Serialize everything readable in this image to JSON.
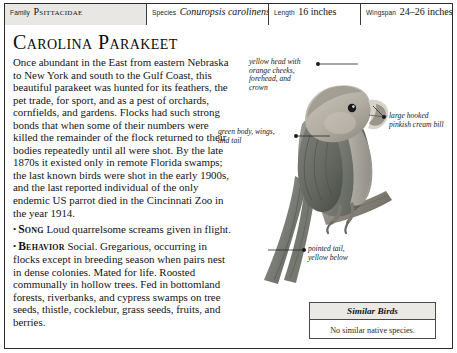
{
  "header": {
    "cells": [
      {
        "label": "Family",
        "value": "Psittacidae"
      },
      {
        "label": "Species",
        "value": "Conuropsis carolinensis"
      },
      {
        "label": "Length",
        "value": "16 inches"
      },
      {
        "label": "Wingspan",
        "value": "24–26 inches"
      }
    ]
  },
  "title": "Carolina Parakeet",
  "body": {
    "main": "Once abundant in the East from eastern Nebraska to New York and south to the Gulf Coast, this beautiful parakeet was hunted for its feathers, the pet trade, for sport, and as a pest of orchards, cornfields, and gardens. Flocks had such strong bonds that when some of their numbers were killed the remainder of the flock returned to their bodies repeatedly until all were shot. By the late 1870s it existed only in remote Florida swamps; the last known birds were shot in the early 1900s, and the last reported individual of the only endemic US parrot died in the Cincinnati Zoo in the year 1914.",
    "song_keyword": "Song",
    "song_text": "Loud quarrelsome screams given in flight.",
    "behavior_keyword": "Behavior",
    "behavior_text": "Social. Gregarious, occurring in flocks except in breeding season when pairs nest in dense colonies. Mated for life. Roosted communally in hollow trees. Fed in bottomland forests, riverbanks, and cypress swamps on tree seeds, thistle, cocklebur, grass seeds, fruits, and berries.",
    "bullet": "•"
  },
  "callouts": {
    "head": "yellow head with\norange cheeks,\nforehead, and\ncrown",
    "body": "green body, wings,\nand tail",
    "bill": "large hooked\npinkish cream bill",
    "tail": "pointed tail,\nyellow below"
  },
  "similar_birds": {
    "heading": "Similar Birds",
    "text": "No similar native species."
  },
  "colors": {
    "page_background": "#ffffff",
    "outer_background": "#8d8d8d",
    "border": "#2b2b2b",
    "header_fill": "#e9e7e4",
    "text": "#131313",
    "bird_body": "#8a8d86",
    "bird_head": "#b9b4aa",
    "bird_wing": "#6f736c"
  }
}
